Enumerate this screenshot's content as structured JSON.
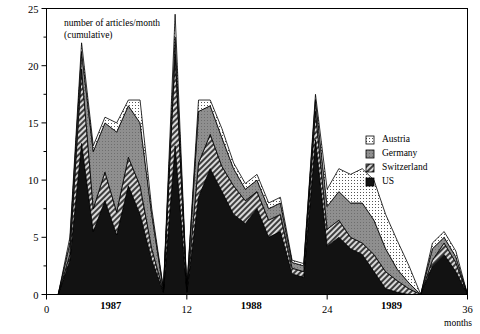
{
  "chart_data": {
    "type": "area",
    "stacked": true,
    "title": "",
    "annotation": "number of articles/month\n(cumulative)",
    "annotation_line1": "number of articles/month",
    "annotation_line2": "(cumulative)",
    "xlabel": "months",
    "ylabel": "",
    "xlim": [
      0,
      36
    ],
    "ylim": [
      0,
      25
    ],
    "grid": false,
    "xticks": [
      0,
      12,
      24,
      36
    ],
    "xticklabels": [
      "0",
      "12",
      "24",
      "36"
    ],
    "xminor_step": 2,
    "yticks": [
      0,
      5,
      10,
      15,
      20,
      25
    ],
    "yticklabels": [
      "0",
      "5",
      "10",
      "15",
      "20",
      "25"
    ],
    "yminor_step": 2.5,
    "year_labels": [
      {
        "label": "1987",
        "x": 5.5
      },
      {
        "label": "1988",
        "x": 17.5
      },
      {
        "label": "1989",
        "x": 29.5
      }
    ],
    "legend_position": "top-right",
    "legend": [
      "Austria",
      "Germany",
      "Switzerland",
      "US"
    ],
    "x": [
      0,
      1,
      2,
      3,
      4,
      5,
      6,
      7,
      8,
      9,
      10,
      11,
      12,
      13,
      14,
      15,
      16,
      17,
      18,
      19,
      20,
      21,
      22,
      23,
      24,
      25,
      26,
      27,
      28,
      29,
      30,
      31,
      32,
      33,
      34,
      35,
      36
    ],
    "series": [
      {
        "name": "US",
        "pattern": "solid-black",
        "color": "#121212",
        "values": [
          0,
          0,
          3,
          13.2,
          5.5,
          8.2,
          5.2,
          9.5,
          7.0,
          3.0,
          0.2,
          13.0,
          0.2,
          8.5,
          11.0,
          9.0,
          7.0,
          6.2,
          7.5,
          5.0,
          5.5,
          1.8,
          1.5,
          13.5,
          4.2,
          5.0,
          4.0,
          3.5,
          2.0,
          0.5,
          0.2,
          0.0,
          0.0,
          2.5,
          3.5,
          2.0,
          0.0
        ]
      },
      {
        "name": "Switzerland",
        "pattern": "diagonal-hatch",
        "color": "#4a4a4a",
        "values": [
          0,
          0,
          0.5,
          6.5,
          2.0,
          2.5,
          2.0,
          2.5,
          2.5,
          1.0,
          0.1,
          8.0,
          0.1,
          3.0,
          3.0,
          2.2,
          2.5,
          2.0,
          1.5,
          1.5,
          1.5,
          0.5,
          0.5,
          2.5,
          1.5,
          1.5,
          1.0,
          1.0,
          1.5,
          1.5,
          1.0,
          0.5,
          0.0,
          0.5,
          1.0,
          0.8,
          0.0
        ]
      },
      {
        "name": "Germany",
        "pattern": "medium-gray",
        "color": "#8c8c8c",
        "values": [
          0,
          0,
          1.0,
          1.5,
          5.0,
          4.3,
          7.0,
          4.5,
          5.5,
          3.0,
          0.1,
          1.5,
          0.1,
          4.5,
          2.5,
          2.5,
          1.5,
          1.0,
          1.0,
          1.0,
          1.0,
          0.5,
          0.5,
          1.0,
          2.0,
          2.5,
          3.0,
          3.5,
          3.0,
          2.0,
          1.0,
          0.5,
          0.0,
          1.0,
          0.5,
          0.5,
          0.0
        ]
      },
      {
        "name": "Austria",
        "pattern": "light-dotted",
        "color": "#e8e8e8",
        "values": [
          0,
          0,
          0.5,
          0.8,
          0.5,
          0.5,
          0.8,
          0.5,
          2.0,
          0.5,
          0.1,
          2.0,
          0.1,
          1.0,
          0.5,
          0.8,
          0.5,
          0.5,
          0.5,
          0.5,
          0.5,
          0.2,
          0.2,
          0.5,
          1.5,
          2.0,
          2.5,
          3.0,
          3.5,
          3.0,
          2.5,
          1.5,
          0.0,
          0.5,
          0.5,
          0.5,
          0.0
        ]
      }
    ],
    "totals": [
      0,
      0,
      5,
      22,
      13,
      15.5,
      15,
      17,
      17,
      7.5,
      0.5,
      24.5,
      0.5,
      17,
      17,
      14.5,
      11.5,
      9.7,
      10.5,
      8,
      8.5,
      3,
      2.7,
      17.5,
      9.2,
      11,
      10.5,
      11,
      10,
      7,
      4.7,
      2.5,
      0,
      4.5,
      5.5,
      3.8,
      0
    ]
  }
}
